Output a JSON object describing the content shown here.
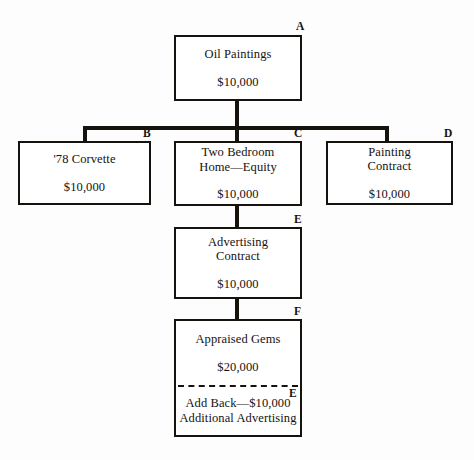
{
  "diagram": {
    "ink_color": "#16130f",
    "background_color": "#fdfdfd",
    "nodes": [
      {
        "tag": "A",
        "title": "Oil Paintings",
        "amount": "$10,000"
      },
      {
        "tag": "B",
        "title": "'78 Corvette",
        "amount": "$10,000"
      },
      {
        "tag": "C",
        "title": "Two Bedroom\nHome—Equity",
        "amount": "$10,000"
      },
      {
        "tag": "D",
        "title": "Painting\nContract",
        "amount": "$10,000"
      },
      {
        "tag": "E",
        "title": "Advertising\nContract",
        "amount": "$10,000"
      },
      {
        "tag": "F",
        "title": "Appraised Gems",
        "amount": "$20,000",
        "sub_tag": "E",
        "sub_title": "Add Back—$10,000\nAdditional Advertising"
      }
    ]
  }
}
